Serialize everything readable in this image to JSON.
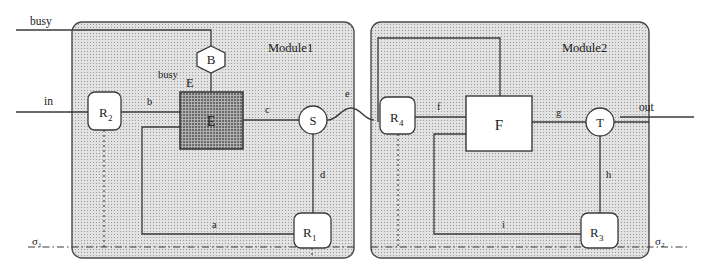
{
  "diagram": {
    "type": "block-diagram",
    "colors": {
      "module_fill": "#c9c9c9",
      "module_stroke": "#4a4a4a",
      "dark_box_fill": "#8e8e8e",
      "white_fill": "#ffffff",
      "line": "#3a3a3a",
      "text": "#1a1a1a"
    },
    "modules": [
      {
        "id": "module1",
        "label": "Module1",
        "boundary_label": "σ₁"
      },
      {
        "id": "module2",
        "label": "Module2",
        "boundary_label": "σ₂"
      }
    ],
    "external_ports": [
      {
        "id": "busy",
        "label": "busy",
        "side": "left-top"
      },
      {
        "id": "in",
        "label": "in",
        "side": "left"
      },
      {
        "id": "out",
        "label": "out",
        "side": "right"
      }
    ],
    "nodes": [
      {
        "id": "B",
        "label": "B",
        "shape": "hexagon",
        "module": "module1"
      },
      {
        "id": "E",
        "label": "E",
        "shape": "rect-dark",
        "module": "module1"
      },
      {
        "id": "R2",
        "label": "R",
        "sub": "2",
        "shape": "rounded-rect",
        "module": "module1"
      },
      {
        "id": "R1",
        "label": "R",
        "sub": "1",
        "shape": "rounded-rect",
        "module": "module1"
      },
      {
        "id": "S",
        "label": "S",
        "shape": "circle",
        "module": "module1"
      },
      {
        "id": "R4",
        "label": "R",
        "sub": "4",
        "shape": "rounded-rect",
        "module": "module2"
      },
      {
        "id": "F",
        "label": "F",
        "shape": "rect-white",
        "module": "module2"
      },
      {
        "id": "R3",
        "label": "R",
        "sub": "3",
        "shape": "rounded-rect",
        "module": "module2"
      },
      {
        "id": "T",
        "label": "T",
        "shape": "circle",
        "module": "module2"
      }
    ],
    "edge_labels": [
      {
        "id": "busy_inner",
        "label": "busy",
        "from": "busy-bus",
        "to": "B"
      },
      {
        "id": "E_top",
        "label": "E",
        "from": "B",
        "to": "E"
      },
      {
        "id": "b",
        "label": "b",
        "from": "R2",
        "to": "E"
      },
      {
        "id": "c",
        "label": "c",
        "from": "E",
        "to": "S"
      },
      {
        "id": "d",
        "label": "d",
        "from": "S",
        "to": "R1"
      },
      {
        "id": "a",
        "label": "a",
        "from": "R1",
        "to": "E"
      },
      {
        "id": "e",
        "label": "e",
        "from": "S",
        "to": "R4"
      },
      {
        "id": "f",
        "label": "f",
        "from": "R4",
        "to": "F"
      },
      {
        "id": "g",
        "label": "g",
        "from": "F",
        "to": "T"
      },
      {
        "id": "h",
        "label": "h",
        "from": "T",
        "to": "R3"
      },
      {
        "id": "i",
        "label": "i",
        "from": "R3",
        "to": "F"
      }
    ]
  }
}
